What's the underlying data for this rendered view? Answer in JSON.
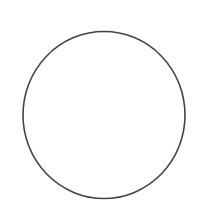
{
  "canvas": {
    "width": 200,
    "height": 210,
    "background": "#ffffff"
  },
  "shapes": [
    {
      "type": "ellipse",
      "cx": 104,
      "cy": 115,
      "rx": 81,
      "ry": 83.5,
      "stroke": "#444444",
      "stroke_width": 1.6,
      "fill": "none"
    }
  ]
}
